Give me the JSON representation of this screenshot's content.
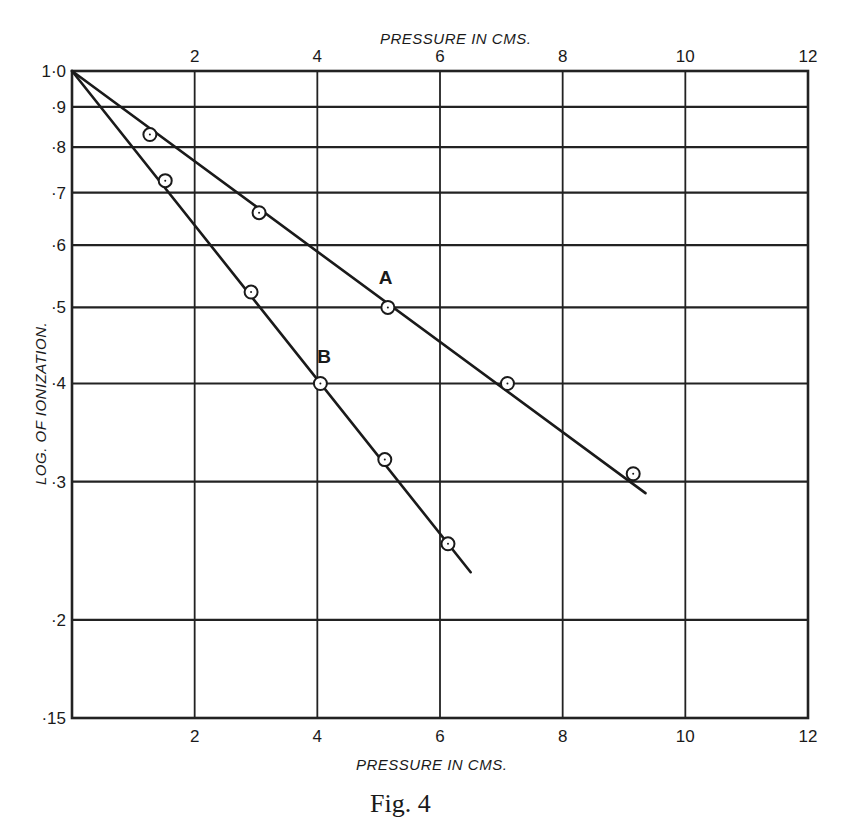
{
  "figure": {
    "caption": "Fig. 4"
  },
  "chart_data": {
    "type": "line",
    "title": "",
    "caption": "Fig. 4",
    "xlabel": "PRESSURE IN CMS.",
    "xlabel_top": "PRESSURE IN CMS.",
    "ylabel": "LOG. OF IONIZATION.",
    "xlim": [
      0,
      12
    ],
    "ylim": [
      0.15,
      1.0
    ],
    "yscale": "log",
    "grid": true,
    "legend": "none (series labelled inline as A and B)",
    "x_ticks": [
      2,
      4,
      6,
      8,
      10,
      12
    ],
    "x_tick_labels": [
      "2",
      "4",
      "6",
      "8",
      "10",
      "12"
    ],
    "y_ticks": [
      1.0,
      0.9,
      0.8,
      0.7,
      0.6,
      0.5,
      0.4,
      0.3,
      0.2,
      0.15
    ],
    "y_tick_labels": [
      "1·0",
      "·9",
      "·8",
      "·7",
      "·6",
      "·5",
      "·4",
      "·3",
      "·2",
      "·15"
    ],
    "series": [
      {
        "name": "A",
        "points": [
          {
            "x": 1.27,
            "y": 0.83
          },
          {
            "x": 3.05,
            "y": 0.66
          },
          {
            "x": 5.15,
            "y": 0.5
          },
          {
            "x": 7.1,
            "y": 0.4
          },
          {
            "x": 9.15,
            "y": 0.307
          }
        ],
        "fit_line": {
          "x0": 0,
          "y0": 1.0,
          "x1": 9.35,
          "y1": 0.29
        },
        "label_position": {
          "x": 5.0,
          "y": 0.535
        }
      },
      {
        "name": "B",
        "points": [
          {
            "x": 1.52,
            "y": 0.725
          },
          {
            "x": 2.92,
            "y": 0.523
          },
          {
            "x": 4.05,
            "y": 0.4
          },
          {
            "x": 5.1,
            "y": 0.32
          },
          {
            "x": 6.13,
            "y": 0.25
          }
        ],
        "fit_line": {
          "x0": 0,
          "y0": 1.0,
          "x1": 6.5,
          "y1": 0.23
        },
        "label_position": {
          "x": 4.0,
          "y": 0.425
        }
      }
    ]
  }
}
